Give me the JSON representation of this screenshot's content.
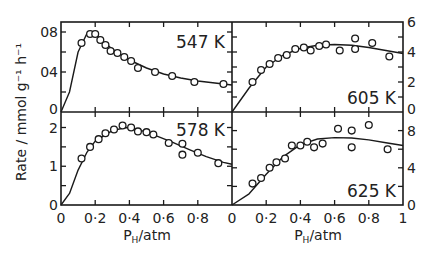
{
  "chart_data": {
    "type": "scatter",
    "layout": "2x2 panels sharing axes",
    "ylabel": "Rate / mmol g⁻¹ h⁻¹",
    "xlabel": "P_H/atm",
    "xlabel_main": "P",
    "xlabel_sub": "H",
    "xlabel_rest": "/atm",
    "xlim": [
      0,
      1
    ],
    "x_ticks": [
      "0",
      "0·2",
      "0·4",
      "0·6",
      "0·8"
    ],
    "x_ticks_right": [
      "0",
      "0·2",
      "0·4",
      "0·6",
      "0·8",
      "1"
    ],
    "grid": false,
    "panels": [
      {
        "label": "547 K",
        "position": "top-left",
        "ylim": [
          0,
          0.09
        ],
        "y_ticks": [
          "0",
          "04",
          "08"
        ],
        "y_tick_values": [
          0,
          0.04,
          0.08
        ],
        "y_axis_side": "left",
        "points": [
          [
            0.12,
            0.069
          ],
          [
            0.17,
            0.078
          ],
          [
            0.2,
            0.078
          ],
          [
            0.23,
            0.072
          ],
          [
            0.26,
            0.067
          ],
          [
            0.29,
            0.061
          ],
          [
            0.33,
            0.059
          ],
          [
            0.37,
            0.055
          ],
          [
            0.41,
            0.051
          ],
          [
            0.45,
            0.044
          ],
          [
            0.55,
            0.04
          ],
          [
            0.65,
            0.036
          ],
          [
            0.78,
            0.03
          ],
          [
            0.95,
            0.028
          ]
        ],
        "curve": [
          [
            0,
            0
          ],
          [
            0.05,
            0.02
          ],
          [
            0.1,
            0.06
          ],
          [
            0.15,
            0.078
          ],
          [
            0.2,
            0.079
          ],
          [
            0.25,
            0.07
          ],
          [
            0.3,
            0.063
          ],
          [
            0.4,
            0.052
          ],
          [
            0.5,
            0.044
          ],
          [
            0.6,
            0.038
          ],
          [
            0.7,
            0.034
          ],
          [
            0.8,
            0.031
          ],
          [
            0.9,
            0.029
          ],
          [
            1.0,
            0.027
          ]
        ]
      },
      {
        "label": "605 K",
        "position": "top-right",
        "ylim": [
          0,
          6
        ],
        "y_ticks": [
          "0",
          "2",
          "4",
          "6"
        ],
        "y_tick_values": [
          0,
          2,
          4,
          6
        ],
        "y_axis_side": "right",
        "points": [
          [
            0.12,
            2.0
          ],
          [
            0.17,
            2.8
          ],
          [
            0.22,
            3.2
          ],
          [
            0.27,
            3.6
          ],
          [
            0.32,
            3.8
          ],
          [
            0.37,
            4.2
          ],
          [
            0.42,
            4.3
          ],
          [
            0.46,
            4.1
          ],
          [
            0.51,
            4.4
          ],
          [
            0.55,
            4.5
          ],
          [
            0.63,
            4.1
          ],
          [
            0.72,
            4.2
          ],
          [
            0.72,
            4.9
          ],
          [
            0.82,
            4.6
          ],
          [
            0.92,
            3.7
          ]
        ],
        "curve": [
          [
            0,
            0
          ],
          [
            0.1,
            1.6
          ],
          [
            0.2,
            3.0
          ],
          [
            0.3,
            3.8
          ],
          [
            0.4,
            4.25
          ],
          [
            0.5,
            4.45
          ],
          [
            0.6,
            4.5
          ],
          [
            0.7,
            4.45
          ],
          [
            0.8,
            4.3
          ],
          [
            0.9,
            4.1
          ],
          [
            1.0,
            3.9
          ]
        ]
      },
      {
        "label": "578 K",
        "position": "bottom-left",
        "ylim": [
          0,
          2.4
        ],
        "y_ticks": [
          "0",
          "1",
          "2"
        ],
        "y_tick_values": [
          0,
          1,
          2
        ],
        "y_axis_side": "left",
        "points": [
          [
            0.12,
            1.2
          ],
          [
            0.17,
            1.5
          ],
          [
            0.22,
            1.7
          ],
          [
            0.26,
            1.85
          ],
          [
            0.31,
            1.95
          ],
          [
            0.36,
            2.05
          ],
          [
            0.41,
            2.0
          ],
          [
            0.45,
            1.9
          ],
          [
            0.5,
            1.88
          ],
          [
            0.54,
            1.82
          ],
          [
            0.63,
            1.6
          ],
          [
            0.71,
            1.58
          ],
          [
            0.71,
            1.3
          ],
          [
            0.8,
            1.35
          ],
          [
            0.92,
            1.08
          ]
        ],
        "curve": [
          [
            0,
            0
          ],
          [
            0.05,
            0.3
          ],
          [
            0.1,
            0.9
          ],
          [
            0.15,
            1.35
          ],
          [
            0.2,
            1.65
          ],
          [
            0.3,
            1.92
          ],
          [
            0.38,
            2.0
          ],
          [
            0.45,
            1.95
          ],
          [
            0.55,
            1.8
          ],
          [
            0.65,
            1.62
          ],
          [
            0.75,
            1.43
          ],
          [
            0.85,
            1.25
          ],
          [
            0.95,
            1.1
          ],
          [
            1.0,
            1.05
          ]
        ]
      },
      {
        "label": "625 K",
        "position": "bottom-right",
        "ylim": [
          0,
          10
        ],
        "y_ticks": [
          "0",
          "4",
          "8"
        ],
        "y_tick_values": [
          0,
          4,
          8
        ],
        "y_axis_side": "right",
        "points": [
          [
            0.12,
            2.3
          ],
          [
            0.17,
            2.9
          ],
          [
            0.22,
            4.0
          ],
          [
            0.26,
            4.6
          ],
          [
            0.31,
            5.0
          ],
          [
            0.35,
            6.4
          ],
          [
            0.4,
            6.4
          ],
          [
            0.44,
            6.8
          ],
          [
            0.48,
            6.2
          ],
          [
            0.53,
            6.6
          ],
          [
            0.62,
            8.2
          ],
          [
            0.7,
            8.0
          ],
          [
            0.7,
            6.2
          ],
          [
            0.8,
            8.6
          ],
          [
            0.91,
            6.0
          ]
        ],
        "curve": [
          [
            0,
            0
          ],
          [
            0.1,
            1.2
          ],
          [
            0.2,
            3.3
          ],
          [
            0.3,
            5.2
          ],
          [
            0.4,
            6.5
          ],
          [
            0.5,
            7.1
          ],
          [
            0.6,
            7.25
          ],
          [
            0.7,
            7.2
          ],
          [
            0.8,
            7.0
          ],
          [
            0.9,
            6.7
          ],
          [
            1.0,
            6.4
          ]
        ]
      }
    ]
  }
}
